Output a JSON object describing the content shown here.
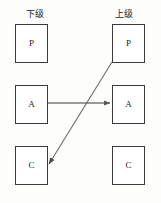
{
  "diagram": {
    "title": "",
    "background_color": "#fdfdfc",
    "box_border_color": "#3a3a3a",
    "box_fill_color": "#ffffff",
    "edge_color": "#6b6b6b",
    "columns": [
      {
        "key": "lower",
        "header": "下级",
        "header_x": 26,
        "header_y": 9
      },
      {
        "key": "upper",
        "header": "上级",
        "header_x": 115,
        "header_y": 9
      }
    ],
    "nodes": [
      {
        "id": "lower-p",
        "label": "P",
        "column": "lower",
        "row": 0,
        "x": 15,
        "y": 24
      },
      {
        "id": "lower-a",
        "label": "A",
        "column": "lower",
        "row": 1,
        "x": 15,
        "y": 85
      },
      {
        "id": "lower-c",
        "label": "C",
        "column": "lower",
        "row": 2,
        "x": 15,
        "y": 146
      },
      {
        "id": "upper-p",
        "label": "P",
        "column": "upper",
        "row": 0,
        "x": 112,
        "y": 24
      },
      {
        "id": "upper-a",
        "label": "A",
        "column": "upper",
        "row": 1,
        "x": 112,
        "y": 85
      },
      {
        "id": "upper-c",
        "label": "C",
        "column": "upper",
        "row": 2,
        "x": 112,
        "y": 146
      }
    ],
    "edges": [
      {
        "id": "edge-lower-a-to-upper-a",
        "from": "lower-a",
        "to": "upper-a",
        "kind": "horizontal-arrow",
        "x1": 48,
        "y1": 103,
        "x2": 110,
        "y2": 103
      },
      {
        "id": "edge-upper-p-to-lower-c",
        "from": "upper-p",
        "to": "lower-c",
        "kind": "diagonal-arrow",
        "x1": 112,
        "y1": 62,
        "x2": 49,
        "y2": 164
      }
    ]
  }
}
